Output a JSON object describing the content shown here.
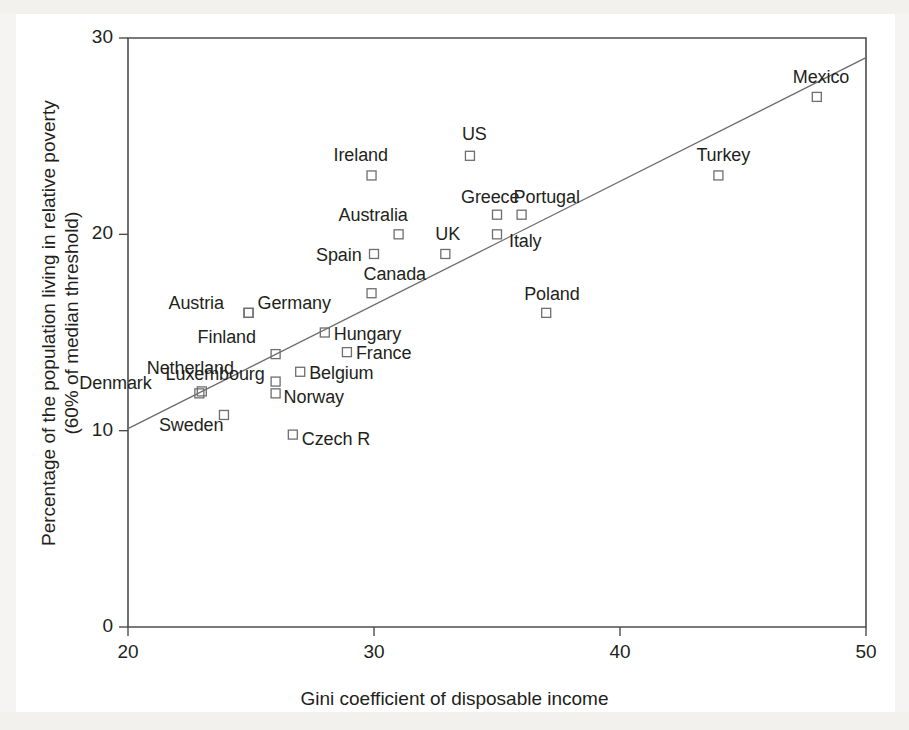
{
  "chart_data": {
    "type": "scatter",
    "title": "",
    "xlabel": "Gini coefficient of disposable income",
    "ylabel_line1": "Percentage of the population living in relative poverty",
    "ylabel_line2": "(60% of median threshold)",
    "xlim": [
      20,
      50
    ],
    "ylim": [
      0,
      30
    ],
    "xticks": [
      "20",
      "30",
      "40",
      "50"
    ],
    "xtick_values": [
      20,
      30,
      40,
      50
    ],
    "yticks": [
      "0",
      "10",
      "20",
      "30"
    ],
    "ytick_values": [
      0,
      10,
      20,
      30
    ],
    "grid": false,
    "legend": "none",
    "marker_style": "open-square",
    "trend_line": {
      "label": "fitted regression line",
      "x_start": 20,
      "y_start": 10.1,
      "x_end": 50,
      "y_end": 29.0
    },
    "points": [
      {
        "label": "Denmark",
        "x": 22.9,
        "y": 11.9,
        "label_dx": -120,
        "label_dy": -11
      },
      {
        "label": "Sweden",
        "x": 23.9,
        "y": 10.8,
        "label_dx": -65,
        "label_dy": 9
      },
      {
        "label": "Netherland",
        "x": 23.0,
        "y": 12.0,
        "label_dx": -55,
        "label_dy": -24
      },
      {
        "label": "Austria",
        "x": 24.9,
        "y": 16.0,
        "label_dx": -80,
        "label_dy": -11
      },
      {
        "label": "Finland",
        "x": 26.0,
        "y": 13.9,
        "label_dx": -78,
        "label_dy": -18
      },
      {
        "label": "Luxembourg",
        "x": 26.0,
        "y": 12.5,
        "label_dx": -110,
        "label_dy": -9
      },
      {
        "label": "Norway",
        "x": 26.0,
        "y": 11.9,
        "label_dx": 8,
        "label_dy": 3
      },
      {
        "label": "Czech R",
        "x": 26.7,
        "y": 9.8,
        "label_dx": 9,
        "label_dy": 3
      },
      {
        "label": "Germany",
        "x": 24.9,
        "y": 16.0,
        "label_dx": 9,
        "label_dy": -11
      },
      {
        "label": "Belgium",
        "x": 27.0,
        "y": 13.0,
        "label_dx": 9,
        "label_dy": 0
      },
      {
        "label": "Hungary",
        "x": 28.0,
        "y": 15.0,
        "label_dx": 9,
        "label_dy": 0
      },
      {
        "label": "France",
        "x": 28.9,
        "y": 14.0,
        "label_dx": 9,
        "label_dy": 0
      },
      {
        "label": "Canada",
        "x": 29.9,
        "y": 17.0,
        "label_dx": -8,
        "label_dy": -20
      },
      {
        "label": "Spain",
        "x": 30.0,
        "y": 19.0,
        "label_dx": -58,
        "label_dy": 0
      },
      {
        "label": "Australia",
        "x": 31.0,
        "y": 20.0,
        "label_dx": -60,
        "label_dy": -20
      },
      {
        "label": "Ireland",
        "x": 29.9,
        "y": 23.0,
        "label_dx": -38,
        "label_dy": -21
      },
      {
        "label": "UK",
        "x": 32.9,
        "y": 19.0,
        "label_dx": -10,
        "label_dy": -21
      },
      {
        "label": "US",
        "x": 33.9,
        "y": 24.0,
        "label_dx": -8,
        "label_dy": -23
      },
      {
        "label": "Greece",
        "x": 35.0,
        "y": 21.0,
        "label_dx": -36,
        "label_dy": -19
      },
      {
        "label": "Italy",
        "x": 35.0,
        "y": 20.0,
        "label_dx": 12,
        "label_dy": 6
      },
      {
        "label": "Portugal",
        "x": 36.0,
        "y": 21.0,
        "label_dx": -8,
        "label_dy": -19
      },
      {
        "label": "Poland",
        "x": 37.0,
        "y": 16.0,
        "label_dx": -22,
        "label_dy": -20
      },
      {
        "label": "Turkey",
        "x": 44.0,
        "y": 23.0,
        "label_dx": -22,
        "label_dy": -21
      },
      {
        "label": "Mexico",
        "x": 48.0,
        "y": 27.0,
        "label_dx": -24,
        "label_dy": -21
      }
    ]
  }
}
